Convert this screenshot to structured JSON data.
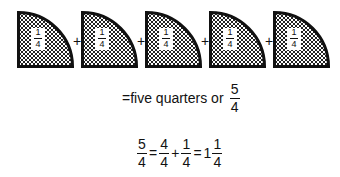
{
  "quarters": {
    "count": 5,
    "items": [
      {
        "numerator": "1",
        "denominator": "4",
        "x": 17
      },
      {
        "numerator": "1",
        "denominator": "4",
        "x": 81
      },
      {
        "numerator": "1",
        "denominator": "4",
        "x": 145
      },
      {
        "numerator": "1",
        "denominator": "4",
        "x": 209
      },
      {
        "numerator": "1",
        "denominator": "4",
        "x": 273
      }
    ],
    "plus_sign": "+",
    "fill_pattern": "checkered",
    "stroke_color": "#111111"
  },
  "statement": {
    "prefix": "=five quarters or",
    "fraction": {
      "numerator": "5",
      "denominator": "4"
    }
  },
  "equation": {
    "terms": [
      {
        "numerator": "5",
        "denominator": "4"
      },
      {
        "op": "="
      },
      {
        "numerator": "4",
        "denominator": "4"
      },
      {
        "op": "+"
      },
      {
        "numerator": "1",
        "denominator": "4"
      },
      {
        "op": "="
      },
      {
        "whole": "1",
        "numerator": "1",
        "denominator": "4"
      }
    ]
  }
}
